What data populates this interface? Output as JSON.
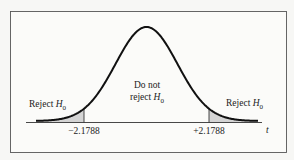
{
  "chart_data": {
    "type": "area",
    "title": "",
    "xlabel": "t",
    "ylabel": "",
    "distribution": "t-distribution (bell curve)",
    "critical_values": [
      -2.1788,
      2.1788
    ],
    "critical_labels": [
      "−2.1788",
      "+2.1788"
    ],
    "regions": [
      {
        "name": "left-rejection",
        "label": "Reject H0",
        "shaded": true,
        "range": [
          "-inf",
          -2.1788
        ]
      },
      {
        "name": "acceptance",
        "label": "Do not reject H0",
        "shaded": false,
        "range": [
          -2.1788,
          2.1788
        ]
      },
      {
        "name": "right-rejection",
        "label": "Reject H0",
        "shaded": true,
        "range": [
          2.1788,
          "inf"
        ]
      }
    ],
    "shade_color": "#d4d4d4",
    "grid": false,
    "legend": "none"
  },
  "labels": {
    "reject_left": "Reject ",
    "reject_right": "Reject ",
    "h": "H",
    "sub0": "0",
    "do_not": "Do not",
    "reject_mid": "reject ",
    "crit_left": "−2.1788",
    "crit_right": "+2.1788",
    "axis": "t"
  }
}
